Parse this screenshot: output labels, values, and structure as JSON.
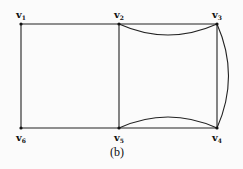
{
  "diagram": {
    "caption": "(b)",
    "vertices": [
      {
        "id": "v1",
        "base": "v",
        "sub": "1",
        "x": 21,
        "y": 24,
        "lx": 16,
        "ly": 10
      },
      {
        "id": "v2",
        "base": "v",
        "sub": "2",
        "x": 119,
        "y": 24,
        "lx": 114,
        "ly": 10
      },
      {
        "id": "v3",
        "base": "v",
        "sub": "3",
        "x": 217,
        "y": 24,
        "lx": 212,
        "ly": 10
      },
      {
        "id": "v4",
        "base": "v",
        "sub": "4",
        "x": 217,
        "y": 128,
        "lx": 212,
        "ly": 132
      },
      {
        "id": "v5",
        "base": "v",
        "sub": "5",
        "x": 119,
        "y": 128,
        "lx": 114,
        "ly": 132
      },
      {
        "id": "v6",
        "base": "v",
        "sub": "6",
        "x": 21,
        "y": 128,
        "lx": 16,
        "ly": 132
      }
    ],
    "edges": [
      {
        "from": "v1",
        "to": "v2",
        "type": "straight"
      },
      {
        "from": "v2",
        "to": "v3",
        "type": "straight"
      },
      {
        "from": "v2",
        "to": "v3",
        "type": "curved"
      },
      {
        "from": "v3",
        "to": "v4",
        "type": "straight"
      },
      {
        "from": "v3",
        "to": "v4",
        "type": "curved"
      },
      {
        "from": "v4",
        "to": "v5",
        "type": "straight"
      },
      {
        "from": "v4",
        "to": "v5",
        "type": "curved"
      },
      {
        "from": "v5",
        "to": "v6",
        "type": "straight"
      },
      {
        "from": "v6",
        "to": "v1",
        "type": "straight"
      },
      {
        "from": "v2",
        "to": "v5",
        "type": "straight"
      }
    ]
  }
}
